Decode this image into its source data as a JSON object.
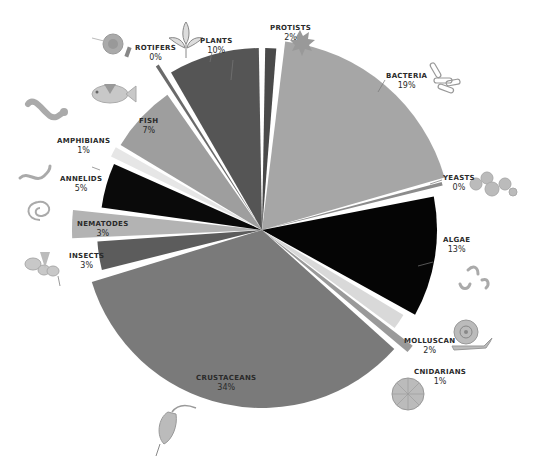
{
  "chart_data": {
    "type": "pie",
    "variant": "exploded pie with varying slice radii",
    "title": "",
    "legend": "none (direct labels with illustrations)",
    "categories": [
      "Protists",
      "Bacteria",
      "Yeasts",
      "Algae",
      "Molluscan",
      "Cnidarians",
      "Crustaceans",
      "Insects",
      "Nematodes",
      "Annelids",
      "Amphibians",
      "Fish",
      "Rotifers",
      "Plants"
    ],
    "values": [
      2,
      19,
      0,
      13,
      2,
      1,
      34,
      3,
      3,
      5,
      1,
      7,
      0,
      10
    ],
    "unit": "%",
    "slices": [
      {
        "name": "PROTISTS",
        "label": "2%",
        "value": 2,
        "color": "#4a4a4a",
        "start": 1,
        "end": 4.5,
        "r": 182
      },
      {
        "name": "BACTERIA",
        "label": "19%",
        "value": 19,
        "color": "#a6a6a6",
        "start": 7,
        "end": 74,
        "r": 190
      },
      {
        "name": "YEASTS",
        "label": "0%",
        "value": 0,
        "color": "#8c8c8c",
        "start": 75,
        "end": 76.2,
        "r": 186
      },
      {
        "name": "ALGAE",
        "label": "13%",
        "value": 13,
        "color": "#050505",
        "start": 79,
        "end": 119,
        "r": 175
      },
      {
        "name": "MOLLUSCAN",
        "label": "2%",
        "value": 2,
        "color": "#d9d9d9",
        "start": 121,
        "end": 126.5,
        "r": 165
      },
      {
        "name": "CNIDARIANS",
        "label": "1%",
        "value": 1,
        "color": "#9a9a9a",
        "start": 127.5,
        "end": 130,
        "r": 190
      },
      {
        "name": "CRUSTACEANS",
        "label": "34%",
        "value": 34,
        "color": "#7a7a7a",
        "start": 132,
        "end": 253,
        "r": 178
      },
      {
        "name": "INSECTS",
        "label": "3%",
        "value": 3,
        "color": "#5c5c5c",
        "start": 256,
        "end": 266,
        "r": 165
      },
      {
        "name": "NEMATODES",
        "label": "3%",
        "value": 3,
        "color": "#b3b3b3",
        "start": 267.5,
        "end": 276,
        "r": 190
      },
      {
        "name": "ANNELIDS",
        "label": "5%",
        "value": 5,
        "color": "#0a0a0a",
        "start": 278,
        "end": 294,
        "r": 162
      },
      {
        "name": "AMPHIBIANS",
        "label": "1%",
        "value": 1,
        "color": "#e6e6e6",
        "start": 296,
        "end": 299.5,
        "r": 168
      },
      {
        "name": "FISH",
        "label": "7%",
        "value": 7,
        "color": "#9e9e9e",
        "start": 301,
        "end": 325,
        "r": 165
      },
      {
        "name": "ROTIFERS",
        "label": "0%",
        "value": 0,
        "color": "#6a6a6a",
        "start": 327,
        "end": 328,
        "r": 195
      },
      {
        "name": "PLANTS",
        "label": "10%",
        "value": 10,
        "color": "#555555",
        "start": 330,
        "end": 359,
        "r": 182
      }
    ],
    "center": [
      262,
      230
    ]
  },
  "labels": {
    "protists": {
      "name": "PROTISTS",
      "pct": "2%"
    },
    "bacteria": {
      "name": "BACTERIA",
      "pct": "19%"
    },
    "yeasts": {
      "name": "YEASTS",
      "pct": "0%"
    },
    "algae": {
      "name": "ALGAE",
      "pct": "13%"
    },
    "molluscan": {
      "name": "MOLLUSCAN",
      "pct": "2%"
    },
    "cnidarians": {
      "name": "CNIDARIANS",
      "pct": "1%"
    },
    "crustaceans": {
      "name": "CRUSTACEANS",
      "pct": "34%"
    },
    "insects": {
      "name": "INSECTS",
      "pct": "3%"
    },
    "nematodes": {
      "name": "NEMATODES",
      "pct": "3%"
    },
    "annelids": {
      "name": "ANNELIDS",
      "pct": "5%"
    },
    "amphibians": {
      "name": "AMPHIBIANS",
      "pct": "1%"
    },
    "fish": {
      "name": "FISH",
      "pct": "7%"
    },
    "rotifers": {
      "name": "ROTIFERS",
      "pct": "0%"
    },
    "plants": {
      "name": "PLANTS",
      "pct": "10%"
    }
  },
  "icons": [
    "rotifer-icon",
    "plant-sprout-icon",
    "protist-amoeba-icon",
    "bacteria-rods-icon",
    "fish-icon",
    "salamander-icon",
    "yeast-cells-icon",
    "worm-icon",
    "algae-chain-icon",
    "nematode-coil-icon",
    "insect-icon",
    "snail-icon",
    "cnidarian-disc-icon",
    "copepod-icon"
  ]
}
